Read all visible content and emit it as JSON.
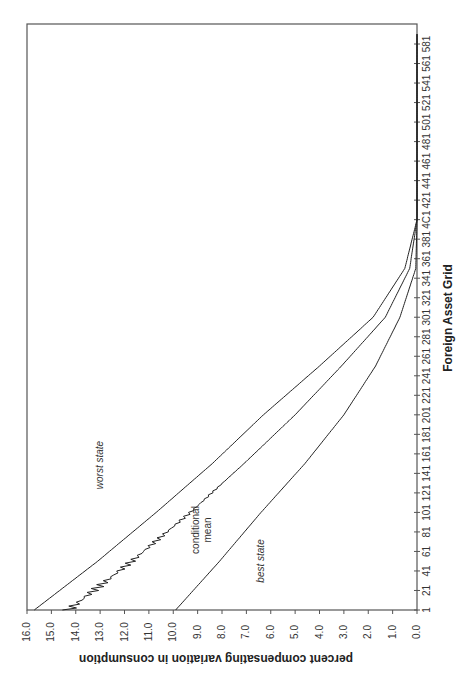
{
  "chart_data": {
    "type": "line",
    "orientation": "rotated-90-clockwise",
    "title": "",
    "xlabel": "Foreign Asset Grid",
    "ylabel": "percent compensating variation in consumption",
    "x_ticks": [
      "1",
      "21",
      "41",
      "61",
      "81",
      "101",
      "121",
      "141",
      "161",
      "181",
      "201",
      "221",
      "241",
      "261",
      "281",
      "301",
      "321",
      "341",
      "361",
      "381",
      "4C1",
      "421",
      "441",
      "461",
      "481",
      "501",
      "521",
      "541",
      "561",
      "581"
    ],
    "y_ticks": [
      "16.0",
      "15.0",
      "14.0",
      "13.0",
      "12.0",
      "11.0",
      "10.0",
      "9.0",
      "8.0",
      "7.0",
      "6.0",
      "5.0",
      "4.0",
      "3.0",
      "2.0",
      "1.0",
      "0.0"
    ],
    "xlim": [
      1,
      600
    ],
    "ylim": [
      0,
      16
    ],
    "grid": false,
    "legend": "none (inline annotations)",
    "x": [
      1,
      51,
      101,
      151,
      201,
      251,
      301,
      351,
      401,
      451,
      501,
      551,
      591
    ],
    "series": [
      {
        "name": "worst state",
        "values": [
          15.7,
          13.1,
          10.7,
          8.4,
          6.3,
          4.0,
          1.8,
          0.5,
          0.0,
          0.0,
          0.0,
          0.0,
          0.0
        ]
      },
      {
        "name": "conditional mean",
        "values": [
          14.3,
          11.7,
          9.3,
          7.1,
          5.0,
          3.1,
          1.3,
          0.3,
          0.0,
          0.0,
          0.0,
          0.0,
          0.0
        ]
      },
      {
        "name": "best state",
        "values": [
          9.9,
          8.1,
          6.4,
          4.6,
          3.0,
          1.7,
          0.7,
          0.05,
          0.0,
          0.0,
          0.0,
          0.0,
          0.0
        ]
      }
    ],
    "annotations": [
      {
        "text": "worst state",
        "series": "worst state"
      },
      {
        "text": "conditional",
        "series": "conditional mean"
      },
      {
        "text": "mean",
        "series": "conditional mean"
      },
      {
        "text": "best state",
        "series": "best state"
      }
    ]
  },
  "labels": {
    "xlabel": "Foreign Asset Grid",
    "ylabel": "percent compensating variation in consumption",
    "annot_worst": "worst state",
    "annot_cond_1": "conditional",
    "annot_cond_2": "mean",
    "annot_best": "best state"
  }
}
